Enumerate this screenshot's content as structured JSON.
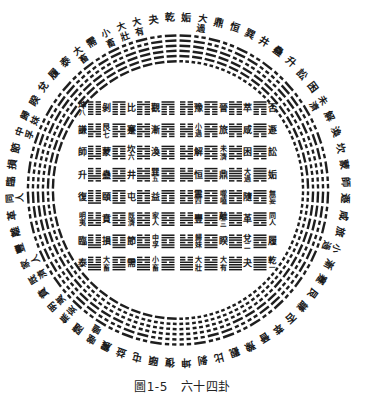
{
  "caption": {
    "label": "圖1-5",
    "title": "六十四卦"
  },
  "colors": {
    "ink": "#1a1a1a",
    "paper": "#ffffff"
  },
  "hexagrams": [
    {
      "name": "坤",
      "lines": "000000"
    },
    {
      "name": "剝",
      "lines": "000001"
    },
    {
      "name": "比",
      "lines": "000010"
    },
    {
      "name": "觀",
      "lines": "000011"
    },
    {
      "name": "豫",
      "lines": "000100"
    },
    {
      "name": "晉",
      "lines": "000101"
    },
    {
      "name": "萃",
      "lines": "000110"
    },
    {
      "name": "否",
      "lines": "000111"
    },
    {
      "name": "謙",
      "lines": "001000"
    },
    {
      "name": "艮",
      "lines": "001001"
    },
    {
      "name": "蹇",
      "lines": "001010"
    },
    {
      "name": "漸",
      "lines": "001011"
    },
    {
      "name": "小過",
      "lines": "001100"
    },
    {
      "name": "旅",
      "lines": "001101"
    },
    {
      "name": "咸",
      "lines": "001110"
    },
    {
      "name": "遯",
      "lines": "001111"
    },
    {
      "name": "師",
      "lines": "010000"
    },
    {
      "name": "蒙",
      "lines": "010001"
    },
    {
      "name": "坎",
      "lines": "010010"
    },
    {
      "name": "渙",
      "lines": "010011"
    },
    {
      "name": "解",
      "lines": "010100"
    },
    {
      "name": "未濟",
      "lines": "010101"
    },
    {
      "name": "困",
      "lines": "010110"
    },
    {
      "name": "訟",
      "lines": "010111"
    },
    {
      "name": "升",
      "lines": "011000"
    },
    {
      "name": "蠱",
      "lines": "011001"
    },
    {
      "name": "井",
      "lines": "011010"
    },
    {
      "name": "巽",
      "lines": "011011"
    },
    {
      "name": "恒",
      "lines": "011100"
    },
    {
      "name": "鼎",
      "lines": "011101"
    },
    {
      "name": "大過",
      "lines": "011110"
    },
    {
      "name": "姤",
      "lines": "011111"
    },
    {
      "name": "復",
      "lines": "100000"
    },
    {
      "name": "頤",
      "lines": "100001"
    },
    {
      "name": "屯",
      "lines": "100010"
    },
    {
      "name": "益",
      "lines": "100011"
    },
    {
      "name": "震",
      "lines": "100100"
    },
    {
      "name": "噬嗑",
      "lines": "100101"
    },
    {
      "name": "隨",
      "lines": "100110"
    },
    {
      "name": "無妄",
      "lines": "100111"
    },
    {
      "name": "明夷",
      "lines": "101000"
    },
    {
      "name": "賁",
      "lines": "101001"
    },
    {
      "name": "既濟",
      "lines": "101010"
    },
    {
      "name": "家人",
      "lines": "101011"
    },
    {
      "name": "豐",
      "lines": "101100"
    },
    {
      "name": "離",
      "lines": "101101"
    },
    {
      "name": "革",
      "lines": "101110"
    },
    {
      "name": "同人",
      "lines": "101111"
    },
    {
      "name": "臨",
      "lines": "110000"
    },
    {
      "name": "損",
      "lines": "110001"
    },
    {
      "name": "節",
      "lines": "110010"
    },
    {
      "name": "中孚",
      "lines": "110011"
    },
    {
      "name": "歸妹",
      "lines": "110100"
    },
    {
      "name": "睽",
      "lines": "110101"
    },
    {
      "name": "兌",
      "lines": "110110"
    },
    {
      "name": "履",
      "lines": "110111"
    },
    {
      "name": "泰",
      "lines": "111000"
    },
    {
      "name": "大畜",
      "lines": "111001"
    },
    {
      "name": "需",
      "lines": "111010"
    },
    {
      "name": "小畜",
      "lines": "111011"
    },
    {
      "name": "大壯",
      "lines": "111100"
    },
    {
      "name": "大有",
      "lines": "111101"
    },
    {
      "name": "夬",
      "lines": "111110"
    },
    {
      "name": "乾",
      "lines": "111111"
    }
  ],
  "ring": {
    "left_from_top": [
      "乾",
      "夬",
      "大有",
      "大壯",
      "小畜",
      "需",
      "大畜",
      "泰",
      "履",
      "兌",
      "睽",
      "歸妹",
      "中孚",
      "節",
      "損",
      "臨",
      "同人",
      "革",
      "離",
      "豐",
      "家人",
      "既濟",
      "賁",
      "明夷",
      "無妄",
      "隨",
      "噬嗑",
      "震",
      "益",
      "屯",
      "頤",
      "復"
    ],
    "right_from_top": [
      "姤",
      "大過",
      "鼎",
      "恒",
      "巽",
      "井",
      "蠱",
      "升",
      "訟",
      "困",
      "未濟",
      "解",
      "渙",
      "坎",
      "蒙",
      "師",
      "遯",
      "咸",
      "旅",
      "小過",
      "漸",
      "蹇",
      "艮",
      "謙",
      "否",
      "萃",
      "晉",
      "豫",
      "觀",
      "比",
      "剝",
      "坤"
    ]
  },
  "square": {
    "rows": [
      [
        "坤",
        "剝",
        "比",
        "觀",
        "豫",
        "晉",
        "萃",
        "否"
      ],
      [
        "謙",
        "艮",
        "蹇",
        "漸",
        "小過",
        "旅",
        "咸",
        "遯"
      ],
      [
        "師",
        "蒙",
        "坎",
        "渙",
        "解",
        "未濟",
        "困",
        "訟"
      ],
      [
        "升",
        "蠱",
        "井",
        "巽",
        "恒",
        "鼎",
        "大過",
        "姤"
      ],
      [
        "復",
        "頤",
        "屯",
        "益",
        "震",
        "噬嗑",
        "隨",
        "無妄"
      ],
      [
        "明夷",
        "賁",
        "既濟",
        "家人",
        "豐",
        "離",
        "革",
        "同人"
      ],
      [
        "臨",
        "損",
        "節",
        "中孚",
        "歸妹",
        "睽",
        "兌",
        "履"
      ],
      [
        "泰",
        "大畜",
        "需",
        "小畜",
        "大壯",
        "大有",
        "夬",
        "乾"
      ]
    ],
    "diagonal_numbers": [
      "八",
      "七",
      "六",
      "五",
      "四",
      "三",
      "二",
      "一"
    ]
  }
}
